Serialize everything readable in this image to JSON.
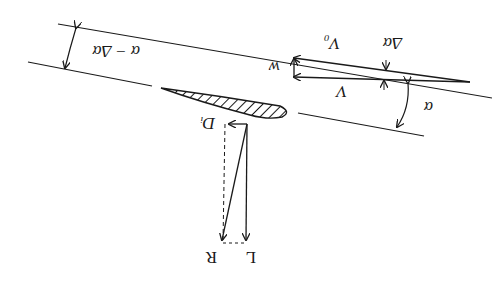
{
  "diagram": {
    "orientation": "rotated-180",
    "labels": {
      "alpha_minus_delta_alpha": "α − Δα",
      "delta_alpha": "Δα",
      "alpha": "α",
      "V0": "V₀",
      "V": "V",
      "w": "w",
      "Di": "Dᵢ",
      "L": "L",
      "R": "R"
    },
    "colors": {
      "line": "#1a1a1a",
      "background": "#ffffff"
    }
  }
}
